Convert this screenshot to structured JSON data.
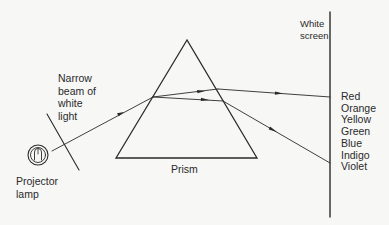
{
  "labels": {
    "screen": "White\nscreen",
    "beam": "Narrow\nbeam of\nwhite\nlight",
    "prism": "Prism",
    "lamp": "Projector\nlamp"
  },
  "spectrum": [
    "Red",
    "Orange",
    "Yellow",
    "Green",
    "Blue",
    "Indigo",
    "Violet"
  ],
  "colors": {
    "ink": "#2a2a2a",
    "background": "#f7f7f6"
  },
  "components": [
    "projector-lamp",
    "slit",
    "prism",
    "white-screen"
  ]
}
